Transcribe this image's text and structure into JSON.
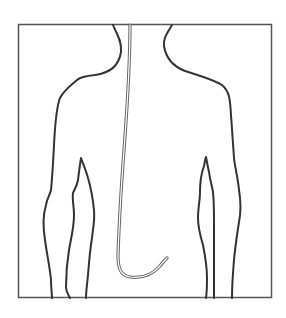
{
  "figure": {
    "description": "Line drawing of a human torso outline (front view) with a thin tube running from the neck down the center and curving near the lower abdomen",
    "colors": {
      "background": "#ffffff",
      "outline": "#333333",
      "frame": "#555555",
      "tube_outer": "#666666",
      "tube_inner": "#ffffff"
    },
    "elements": [
      "frame",
      "torso-outline",
      "left-arm-outline",
      "right-arm-outline",
      "tube"
    ]
  }
}
